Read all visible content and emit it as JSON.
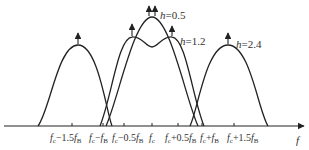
{
  "diagram": {
    "axis_label": "f",
    "ticks": [
      {
        "main": "f",
        "sub": "c",
        "rest": "−1.5",
        "f2": "f",
        "sub2": "B",
        "x": 72
      },
      {
        "main": "f",
        "sub": "c",
        "rest": "−",
        "f2": "f",
        "sub2": "B",
        "x": 103
      },
      {
        "main": "f",
        "sub": "c",
        "rest": "−0.5",
        "f2": "f",
        "sub2": "B",
        "x": 124
      },
      {
        "main": "f",
        "sub": "c",
        "rest": "",
        "f2": "",
        "sub2": "",
        "x": 152
      },
      {
        "main": "f",
        "sub": "c",
        "rest": "+0.5",
        "f2": "f",
        "sub2": "B",
        "x": 178
      },
      {
        "main": "f",
        "sub": "c",
        "rest": "+",
        "f2": "f",
        "sub2": "B",
        "x": 202
      },
      {
        "main": "f",
        "sub": "c",
        "rest": "+1.5",
        "f2": "f",
        "sub2": "B",
        "x": 234
      }
    ],
    "curves": [
      {
        "name": "h=0.5",
        "h_symbol": "h",
        "h_value": "=0.5"
      },
      {
        "name": "h=1.2",
        "h_symbol": "h",
        "h_value": "=1.2"
      },
      {
        "name": "h=2.4",
        "h_symbol": "h",
        "h_value": "=2.4"
      }
    ],
    "colors": {
      "line": "#222222",
      "text": "#333333",
      "background": "#ffffff"
    }
  }
}
